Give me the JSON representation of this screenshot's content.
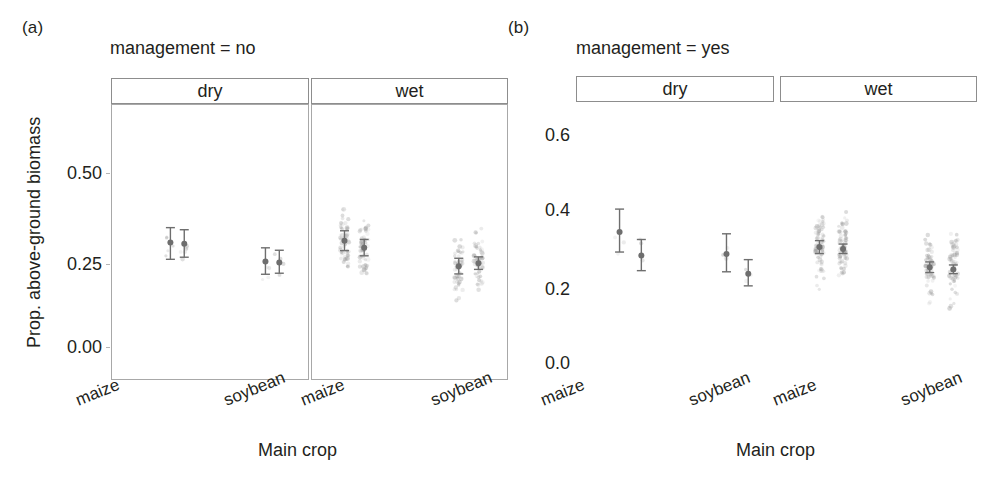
{
  "figure": {
    "panel_a_tag": "(a)",
    "panel_b_tag": "(b)",
    "panel_a_title": "management = no",
    "panel_b_title": "management = yes",
    "xlabel": "Main crop",
    "ylabel": "Prop. above-ground biomass",
    "strip_dry": "dry",
    "strip_wet": "wet",
    "xtick_maize": "maize",
    "xtick_soybean": "soybean",
    "point_color": "#6e6e6e",
    "scatter_color": "#9a9a9a",
    "strip_border": "#8d8d8d",
    "panel_border": "#a8a8a8"
  },
  "chart_data": [
    {
      "type": "scatter",
      "id": "panel-a",
      "title": "management = no",
      "xlabel": "Main crop",
      "ylabel": "Prop. above-ground biomass",
      "ylim": [
        -0.06,
        0.62
      ],
      "yticks": [
        0.0,
        0.25,
        0.5
      ],
      "ytick_labels": [
        "0.00",
        "0.25",
        "0.50"
      ],
      "grid": false,
      "facets": [
        "dry",
        "wet"
      ],
      "categories": [
        "maize",
        "soybean"
      ],
      "series": [
        {
          "name": "observed",
          "role": "estimate"
        },
        {
          "name": "predicted",
          "role": "estimate"
        }
      ],
      "estimates": [
        {
          "facet": "dry",
          "crop": "maize",
          "series": "observed",
          "x": 0.3,
          "y": 0.3,
          "lo": 0.252,
          "hi": 0.343
        },
        {
          "facet": "dry",
          "crop": "maize",
          "series": "predicted",
          "x": 0.37,
          "y": 0.297,
          "lo": 0.258,
          "hi": 0.337
        },
        {
          "facet": "dry",
          "crop": "soybean",
          "series": "observed",
          "x": 0.78,
          "y": 0.246,
          "lo": 0.209,
          "hi": 0.285
        },
        {
          "facet": "dry",
          "crop": "soybean",
          "series": "predicted",
          "x": 0.85,
          "y": 0.243,
          "lo": 0.212,
          "hi": 0.278
        },
        {
          "facet": "wet",
          "crop": "maize",
          "series": "observed",
          "x": 0.17,
          "y": 0.305,
          "lo": 0.277,
          "hi": 0.334
        },
        {
          "facet": "wet",
          "crop": "maize",
          "series": "predicted",
          "x": 0.27,
          "y": 0.285,
          "lo": 0.262,
          "hi": 0.309
        },
        {
          "facet": "wet",
          "crop": "soybean",
          "series": "observed",
          "x": 0.75,
          "y": 0.232,
          "lo": 0.21,
          "hi": 0.255
        },
        {
          "facet": "wet",
          "crop": "soybean",
          "series": "predicted",
          "x": 0.85,
          "y": 0.241,
          "lo": 0.223,
          "hi": 0.259
        }
      ],
      "raw_counts": {
        "dry_maize": 9,
        "dry_soybean": 7,
        "wet_maize": 120,
        "wet_soybean": 110
      }
    },
    {
      "type": "scatter",
      "id": "panel-b",
      "title": "management = yes",
      "xlabel": "Main crop",
      "ylabel": "",
      "ylim": [
        -0.05,
        0.7
      ],
      "yticks": [
        0.0,
        0.2,
        0.4,
        0.6
      ],
      "ytick_labels": [
        "0.0",
        "0.2",
        "0.4",
        "0.6"
      ],
      "grid": false,
      "facets": [
        "dry",
        "wet"
      ],
      "categories": [
        "maize",
        "soybean"
      ],
      "series": [
        {
          "name": "observed",
          "role": "estimate"
        },
        {
          "name": "predicted",
          "role": "estimate"
        }
      ],
      "estimates": [
        {
          "facet": "dry",
          "crop": "maize",
          "series": "observed",
          "x": 0.22,
          "y": 0.345,
          "lo": 0.292,
          "hi": 0.405
        },
        {
          "facet": "dry",
          "crop": "maize",
          "series": "predicted",
          "x": 0.33,
          "y": 0.283,
          "lo": 0.243,
          "hi": 0.325
        },
        {
          "facet": "dry",
          "crop": "soybean",
          "series": "observed",
          "x": 0.76,
          "y": 0.287,
          "lo": 0.24,
          "hi": 0.34
        },
        {
          "facet": "dry",
          "crop": "soybean",
          "series": "predicted",
          "x": 0.87,
          "y": 0.235,
          "lo": 0.203,
          "hi": 0.272
        },
        {
          "facet": "wet",
          "crop": "maize",
          "series": "observed",
          "x": 0.2,
          "y": 0.305,
          "lo": 0.288,
          "hi": 0.322
        },
        {
          "facet": "wet",
          "crop": "maize",
          "series": "predicted",
          "x": 0.32,
          "y": 0.3,
          "lo": 0.288,
          "hi": 0.313
        },
        {
          "facet": "wet",
          "crop": "soybean",
          "series": "observed",
          "x": 0.76,
          "y": 0.252,
          "lo": 0.238,
          "hi": 0.266
        },
        {
          "facet": "wet",
          "crop": "soybean",
          "series": "predicted",
          "x": 0.88,
          "y": 0.246,
          "lo": 0.235,
          "hi": 0.258
        }
      ],
      "raw_counts": {
        "dry_maize": 6,
        "dry_soybean": 5,
        "wet_maize": 150,
        "wet_soybean": 130
      }
    }
  ]
}
